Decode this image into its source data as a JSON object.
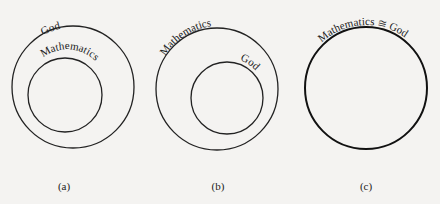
{
  "diagram": {
    "panels": [
      {
        "id": "a",
        "caption": "(a)",
        "outer": {
          "label": "God",
          "cx": 73,
          "cy": 87,
          "r": 61
        },
        "inner": {
          "label": "Mathematics",
          "cx": 65,
          "cy": 95,
          "r": 37
        }
      },
      {
        "id": "b",
        "caption": "(b)",
        "outer": {
          "label": "Mathematics",
          "cx": 217,
          "cy": 89,
          "r": 61
        },
        "inner": {
          "label": "God",
          "cx": 227,
          "cy": 98,
          "r": 36
        }
      },
      {
        "id": "c",
        "caption": "(c)",
        "single": {
          "label": "Mathematics ≅ God",
          "cx": 366,
          "cy": 88,
          "r": 61
        }
      }
    ],
    "colors": {
      "background": "#f4f3f1",
      "stroke": "#222222"
    }
  }
}
